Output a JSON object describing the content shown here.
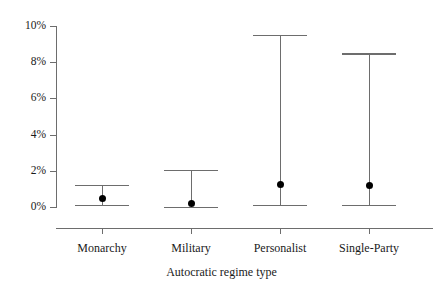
{
  "chart_data": {
    "type": "scatter",
    "title": "",
    "subtitle": "",
    "xlabel": "Autocratic regime type",
    "ylabel": "",
    "categories": [
      "Monarchy",
      "Military",
      "Personalist",
      "Single-Party"
    ],
    "values": [
      0.45,
      0.2,
      1.25,
      1.2
    ],
    "error_low": [
      0.13,
      0.0,
      0.12,
      0.12
    ],
    "error_high": [
      1.22,
      2.05,
      9.5,
      8.5
    ],
    "series": [
      {
        "name": "Point estimate with 95% confidence interval",
        "points": [
          {
            "category": "Monarchy",
            "value": 0.45,
            "low": 0.13,
            "high": 1.22
          },
          {
            "category": "Military",
            "value": 0.2,
            "low": 0.0,
            "high": 2.05
          },
          {
            "category": "Personalist",
            "value": 1.25,
            "low": 0.12,
            "high": 9.5
          },
          {
            "category": "Single-Party",
            "value": 1.2,
            "low": 0.12,
            "high": 8.5
          }
        ]
      }
    ],
    "ylim": [
      -0.9,
      10.0
    ],
    "ytick_values": [
      0,
      2,
      4,
      6,
      8,
      10
    ],
    "ytick_labels": [
      "0%",
      "2%",
      "4%",
      "6%",
      "8%",
      "10%"
    ],
    "grid": false,
    "legend": null,
    "legend_position": "none",
    "marker": "filled-circle",
    "axis_color": "#6d6d6d",
    "marker_color": "#000000",
    "background_color": "#ffffff"
  },
  "axis": {
    "x_title": "Autocratic regime type",
    "y_labels": [
      "10%",
      "8%",
      "6%",
      "4%",
      "2%",
      "0%"
    ],
    "x_labels": [
      "Monarchy",
      "Military",
      "Personalist",
      "Single-Party"
    ]
  }
}
